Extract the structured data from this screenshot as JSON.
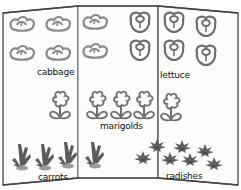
{
  "colors": {
    "outline": "#555555",
    "panel_fill": "#fdfdfd",
    "cabbage": "#8a8a8a",
    "lettuce": "#6e6e6e",
    "marigold": "#6f6f6f",
    "carrot_leaf": "#5c5c5c",
    "carrot_root": "#9a9a9a",
    "radish": "#5e5e5e"
  },
  "panels": [
    {
      "name": "left"
    },
    {
      "name": "middle"
    },
    {
      "name": "right"
    }
  ],
  "sections": [
    {
      "id": "cabbage",
      "label": "cabbage",
      "count": 8
    },
    {
      "id": "lettuce",
      "label": "lettuce",
      "count": 6
    },
    {
      "id": "marigolds",
      "label": "marigolds",
      "count": 5
    },
    {
      "id": "carrots",
      "label": "carrots",
      "count": 4
    },
    {
      "id": "radishes",
      "label": "radishes",
      "count": 8
    }
  ]
}
